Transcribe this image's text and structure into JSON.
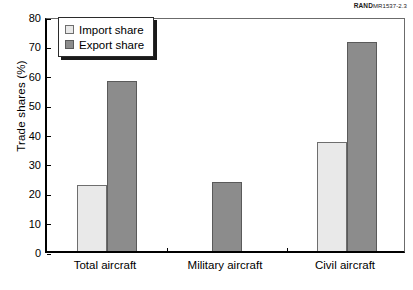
{
  "source_id": {
    "brand": "RAND",
    "document": "MR1537-2.3"
  },
  "chart_data": {
    "type": "bar",
    "title": "",
    "xlabel": "",
    "ylabel": "Trade shares (%)",
    "ylim": [
      0,
      80
    ],
    "ytick_step": 10,
    "yticks": [
      "0",
      "10",
      "20",
      "30",
      "40",
      "50",
      "60",
      "70",
      "80"
    ],
    "grid": false,
    "legend_position": "top-left",
    "categories": [
      "Total aircraft",
      "Military aircraft",
      "Civil aircraft"
    ],
    "series": [
      {
        "name": "Import share",
        "color": "#e9e9e9",
        "values": [
          22.5,
          null,
          37
        ]
      },
      {
        "name": "Export share",
        "color": "#8c8c8c",
        "values": [
          58,
          23.5,
          71
        ]
      }
    ]
  },
  "legend": {
    "items": [
      {
        "label": "Import share",
        "swatch": "import"
      },
      {
        "label": "Export share",
        "swatch": "export"
      }
    ]
  }
}
